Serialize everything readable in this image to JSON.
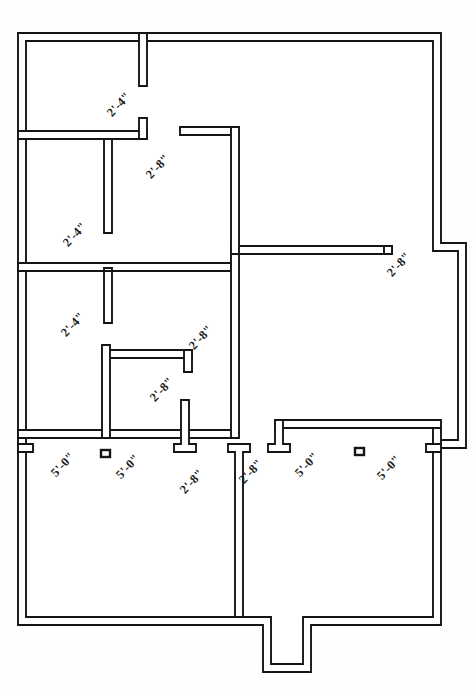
{
  "document": {
    "type": "architectural-floor-plan",
    "title": "Floor Plan",
    "background_color": "#fdfdfd",
    "line_color": "#151515",
    "wall_fill_color": "#ffffff"
  },
  "dimensions": {
    "width_px": 476,
    "height_px": 696
  },
  "labels": [
    {
      "id": "d1",
      "text": "2'-4\"",
      "x": 104,
      "y": 110,
      "rotation": -47,
      "note": "top interior partition opening"
    },
    {
      "id": "d2",
      "text": "2'-8\"",
      "x": 143,
      "y": 172,
      "rotation": -47,
      "note": "upper hall opening"
    },
    {
      "id": "d3",
      "text": "2'-4\"",
      "x": 60,
      "y": 240,
      "rotation": -47,
      "note": "middle left bedroom door"
    },
    {
      "id": "d4",
      "text": "2'-8\"",
      "x": 384,
      "y": 270,
      "rotation": -47,
      "note": "right wing opening"
    },
    {
      "id": "d5",
      "text": "2'-4\"",
      "x": 58,
      "y": 330,
      "rotation": -47,
      "note": "lower left bedroom door"
    },
    {
      "id": "d6",
      "text": "2'-8\"",
      "x": 186,
      "y": 343,
      "rotation": -47,
      "note": "bath door"
    },
    {
      "id": "d7",
      "text": "2'-8\"",
      "x": 147,
      "y": 395,
      "rotation": -47,
      "note": "closet / bath opening"
    },
    {
      "id": "d8",
      "text": "5'-0\"",
      "x": 48,
      "y": 470,
      "rotation": -47,
      "note": "left porch bay"
    },
    {
      "id": "d9",
      "text": "5'-0\"",
      "x": 113,
      "y": 472,
      "rotation": -47,
      "note": "left porch bay 2"
    },
    {
      "id": "d10",
      "text": "2'-8\"",
      "x": 177,
      "y": 487,
      "rotation": -47,
      "note": "left porch to hall opening"
    },
    {
      "id": "d11",
      "text": "2'-8\"",
      "x": 236,
      "y": 477,
      "rotation": -47,
      "note": "right porch hall opening"
    },
    {
      "id": "d12",
      "text": "5'-0\"",
      "x": 292,
      "y": 470,
      "rotation": -47,
      "note": "right porch bay"
    },
    {
      "id": "d13",
      "text": "5'-0\"",
      "x": 374,
      "y": 473,
      "rotation": -47,
      "note": "right porch bay 2"
    }
  ],
  "posts": [
    {
      "id": "p1",
      "x": 101,
      "y": 450,
      "w": 9,
      "h": 7
    },
    {
      "id": "p2",
      "x": 355,
      "y": 448,
      "w": 9,
      "h": 7
    }
  ],
  "walls": {
    "exterior_outline": "Perimeter with right-side bay projection and bottom-center entry stoop",
    "interior_partitions": 14
  }
}
